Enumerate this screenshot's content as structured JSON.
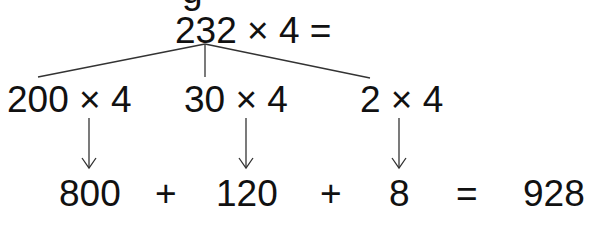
{
  "top_partial_glyph": "g",
  "root": {
    "expression": "232 × 4 ="
  },
  "branches": [
    {
      "expression": "200 × 4",
      "result": "800"
    },
    {
      "expression": "30 × 4",
      "result": "120"
    },
    {
      "expression": "2 × 4",
      "result": "8"
    }
  ],
  "operators": {
    "plus1": "+",
    "plus2": "+",
    "equals": "="
  },
  "total": "928",
  "colors": {
    "text": "#111111",
    "lines": "#333333",
    "background": "#ffffff"
  }
}
